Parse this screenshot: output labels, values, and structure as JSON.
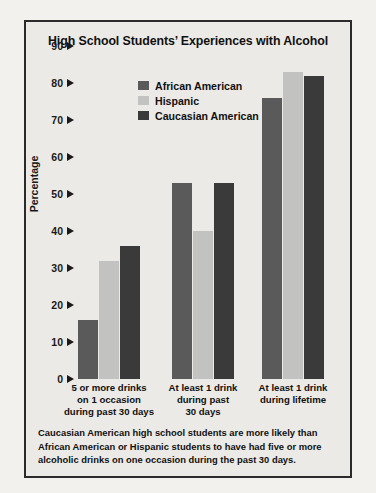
{
  "card": {
    "title": "High School Students’ Experiences with Alcohol",
    "footnote": "Caucasian American high school students are more likely than African American or Hispanic students to have had five or more alcoholic drinks on one occasion during the past 30 days."
  },
  "chart_data": {
    "type": "bar",
    "title": "High School Students’ Experiences with Alcohol",
    "xlabel": "",
    "ylabel": "Percentage",
    "ylim": [
      0,
      90
    ],
    "ytick_step": 10,
    "yticks": [
      90,
      80,
      70,
      60,
      50,
      40,
      30,
      20,
      10,
      0
    ],
    "grid": false,
    "legend_position": "top-center",
    "categories": [
      "5 or more drinks on 1 occasion during past 30 days",
      "At least 1 drink during past 30 days",
      "At least 1 drink during lifetime"
    ],
    "category_lines": [
      [
        "5 or more drinks",
        "on 1 occasion",
        "during past 30 days"
      ],
      [
        "At least 1 drink",
        "during past",
        "30 days"
      ],
      [
        "At least 1 drink",
        "during lifetime"
      ]
    ],
    "series": [
      {
        "name": "African American",
        "color": "#5a5a5a",
        "values": [
          16,
          53,
          76
        ]
      },
      {
        "name": "Hispanic",
        "color": "#c2c2c0",
        "values": [
          32,
          40,
          83
        ]
      },
      {
        "name": "Caucasian American",
        "color": "#3a3a3a",
        "values": [
          36,
          53,
          82
        ]
      }
    ]
  }
}
